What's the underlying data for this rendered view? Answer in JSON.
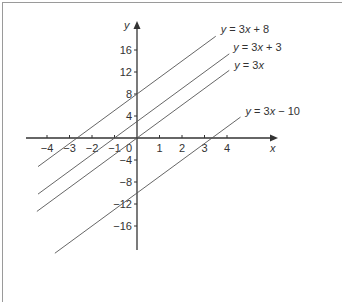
{
  "chart_data": {
    "type": "line",
    "title": "",
    "xlabel": "x",
    "ylabel": "y",
    "xlim": [
      -4.8,
      6.2
    ],
    "ylim": [
      -20.5,
      21
    ],
    "grid": false,
    "x_ticks": [
      -4,
      -3,
      -2,
      -1,
      1,
      2,
      3,
      4
    ],
    "x_tick_labels": [
      "−4",
      "−3",
      "−2",
      "−1",
      "1",
      "2",
      "3",
      "4"
    ],
    "y_ticks": [
      16,
      12,
      8,
      4,
      -4,
      -8,
      -12,
      -16
    ],
    "y_tick_labels": [
      "16",
      "12",
      "8",
      "4",
      "−4",
      "−8",
      "−12",
      "−16"
    ],
    "origin_label": "0",
    "series": [
      {
        "name": "y = 3x + 8",
        "slope": 3,
        "intercept": 8,
        "x_range": [
          -4.4,
          3.5
        ],
        "label_parts": [
          "y",
          " = 3",
          "x",
          " + 8"
        ]
      },
      {
        "name": "y = 3x + 3",
        "slope": 3,
        "intercept": 3,
        "x_range": [
          -4.4,
          4.1
        ],
        "label_parts": [
          "y",
          " = 3",
          "x",
          " + 3"
        ]
      },
      {
        "name": "y = 3x",
        "slope": 3,
        "intercept": 0,
        "x_range": [
          -4.45,
          4.1
        ],
        "label_parts": [
          "y",
          " = 3",
          "x",
          ""
        ]
      },
      {
        "name": "y = 3x − 10",
        "slope": 3,
        "intercept": -10,
        "x_range": [
          -3.65,
          4.6
        ],
        "label_parts": [
          "y",
          " = 3",
          "x",
          " − 10"
        ]
      }
    ],
    "colors": {
      "line": "#555555",
      "axis": "#333333",
      "frame": "#9a9a9a"
    }
  }
}
